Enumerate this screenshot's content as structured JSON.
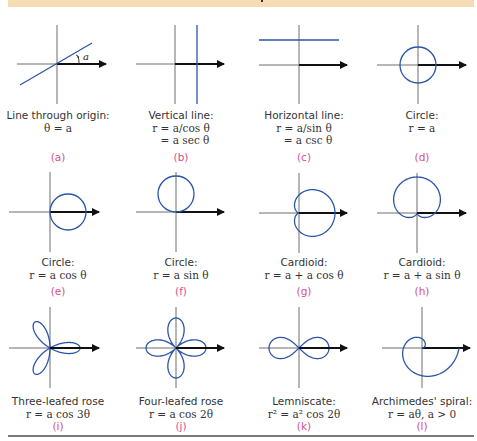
{
  "header": {
    "band_color": "#f6dcb4"
  },
  "colors": {
    "curve": "#2b55a8",
    "axis": "#6e6e6e",
    "polar_axis": "#111111",
    "label": "#d4508c",
    "rule": "#7a7a7a"
  },
  "panels": [
    {
      "id": "a",
      "title": "Line through origin:",
      "eq1": "θ = a",
      "eq2": "",
      "label": "(a)",
      "angle_label": "a"
    },
    {
      "id": "b",
      "title": "Vertical line:",
      "eq1": "r = a/cos θ",
      "eq2": "= a sec θ",
      "label": "(b)"
    },
    {
      "id": "c",
      "title": "Horizontal line:",
      "eq1": "r = a/sin θ",
      "eq2": "= a csc θ",
      "label": "(c)"
    },
    {
      "id": "d",
      "title": "Circle:",
      "eq1": "r = a",
      "eq2": "",
      "label": "(d)"
    },
    {
      "id": "e",
      "title": "Circle:",
      "eq1": "r = a cos θ",
      "eq2": "",
      "label": "(e)"
    },
    {
      "id": "f",
      "title": "Circle:",
      "eq1": "r = a sin θ",
      "eq2": "",
      "label": "(f)"
    },
    {
      "id": "g",
      "title": "Cardioid:",
      "eq1": "r = a + a cos θ",
      "eq2": "",
      "label": "(g)"
    },
    {
      "id": "h",
      "title": "Cardioid:",
      "eq1": "r = a + a sin θ",
      "eq2": "",
      "label": "(h)"
    },
    {
      "id": "i",
      "title": "Three-leafed rose",
      "eq1": "r = a cos 3θ",
      "eq2": "",
      "label": "(i)"
    },
    {
      "id": "j",
      "title": "Four-leafed rose",
      "eq1": "r = a cos 2θ",
      "eq2": "",
      "label": "(j)"
    },
    {
      "id": "k",
      "title": "Lemniscate:",
      "eq1": "r² = a² cos 2θ",
      "eq2": "",
      "label": "(k)"
    },
    {
      "id": "l",
      "title": "Archimedes' spiral:",
      "eq1": "r = aθ, a > 0",
      "eq2": "",
      "label": "(l)"
    }
  ]
}
